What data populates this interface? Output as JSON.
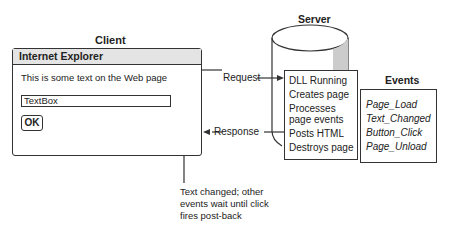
{
  "client": {
    "label": "Client",
    "window_title": "Internet Explorer",
    "page_text": "This is some text on the Web page",
    "textbox_value": "TextBox",
    "ok_button": "OK"
  },
  "server": {
    "label": "Server",
    "steps": [
      "DLL Running",
      "Creates page",
      "Processes page events",
      "Posts HTML",
      "Destroys page"
    ]
  },
  "arrows": {
    "request": "Request",
    "response": "Response"
  },
  "events": {
    "label": "Events",
    "items": [
      "Page_Load",
      "Text_Changed",
      "Button_Click",
      "Page_Unload"
    ]
  },
  "annotation": {
    "lines": [
      "Text changed; other",
      "events wait until click",
      "fires post-back"
    ]
  },
  "colors": {
    "line": "#333333",
    "titlebar": "#e4e4e4",
    "cylinder_shade": "#cccccc"
  }
}
